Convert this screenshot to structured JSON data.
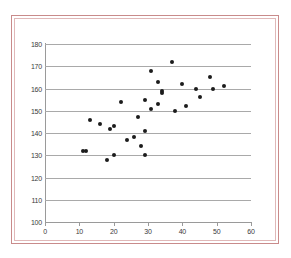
{
  "chart_data": {
    "type": "scatter",
    "title": "",
    "subtitle": "",
    "xlabel": "",
    "ylabel": "",
    "xlim": [
      0,
      60
    ],
    "ylim": [
      100,
      180
    ],
    "x_ticks": [
      0,
      10,
      20,
      30,
      40,
      50,
      60
    ],
    "y_ticks": [
      100,
      110,
      120,
      130,
      140,
      150,
      160,
      170,
      180
    ],
    "grid": "horizontal",
    "legend": "none",
    "marker_color": "#1c1c1c",
    "marker_shape": "circle",
    "series": [
      {
        "name": "observations",
        "points": [
          {
            "x": 11,
            "y": 132
          },
          {
            "x": 12,
            "y": 132
          },
          {
            "x": 13,
            "y": 146
          },
          {
            "x": 16,
            "y": 144
          },
          {
            "x": 18,
            "y": 128
          },
          {
            "x": 19,
            "y": 142
          },
          {
            "x": 20,
            "y": 143
          },
          {
            "x": 20,
            "y": 130
          },
          {
            "x": 22,
            "y": 154
          },
          {
            "x": 24,
            "y": 137
          },
          {
            "x": 26,
            "y": 138
          },
          {
            "x": 27,
            "y": 147
          },
          {
            "x": 28,
            "y": 134
          },
          {
            "x": 29,
            "y": 155
          },
          {
            "x": 29,
            "y": 141
          },
          {
            "x": 29,
            "y": 130
          },
          {
            "x": 31,
            "y": 168
          },
          {
            "x": 31,
            "y": 151
          },
          {
            "x": 33,
            "y": 163
          },
          {
            "x": 33,
            "y": 153
          },
          {
            "x": 34,
            "y": 159
          },
          {
            "x": 34,
            "y": 158
          },
          {
            "x": 37,
            "y": 172
          },
          {
            "x": 38,
            "y": 150
          },
          {
            "x": 40,
            "y": 162
          },
          {
            "x": 41,
            "y": 152
          },
          {
            "x": 44,
            "y": 160
          },
          {
            "x": 45,
            "y": 156
          },
          {
            "x": 48,
            "y": 165
          },
          {
            "x": 49,
            "y": 160
          },
          {
            "x": 52,
            "y": 161
          }
        ]
      }
    ]
  },
  "frame": {
    "outer_border_color": "#c98b8b",
    "inner_border_color": "#e0b8b8",
    "background_color": "#ffffff"
  },
  "axes": {
    "gridline_color": "#a9a9a9",
    "axis_line_color": "#9a9a9a",
    "tick_label_color": "#3a3a3a"
  }
}
